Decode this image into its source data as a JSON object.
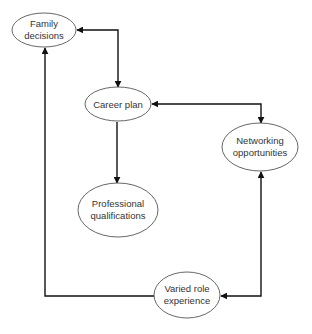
{
  "diagram": {
    "type": "flow",
    "nodes": [
      {
        "id": "family",
        "lines": [
          "Family",
          "decisions"
        ],
        "cx": 44,
        "cy": 30,
        "rx": 32,
        "ry": 17
      },
      {
        "id": "career",
        "lines": [
          "Career plan"
        ],
        "cx": 118,
        "cy": 104,
        "rx": 33,
        "ry": 17
      },
      {
        "id": "networking",
        "lines": [
          "Networking",
          "opportunities"
        ],
        "cx": 260,
        "cy": 147,
        "rx": 38,
        "ry": 24
      },
      {
        "id": "professional",
        "lines": [
          "Professional",
          "qualifications"
        ],
        "cx": 118,
        "cy": 210,
        "rx": 40,
        "ry": 27
      },
      {
        "id": "varied",
        "lines": [
          "Varied role",
          "experience"
        ],
        "cx": 187,
        "cy": 295,
        "rx": 33,
        "ry": 23
      }
    ],
    "edges": [
      {
        "from": "career",
        "to": "family",
        "bidirectional": true,
        "label": ""
      },
      {
        "from": "career",
        "to": "professional",
        "bidirectional": false,
        "label": ""
      },
      {
        "from": "career",
        "to": "networking",
        "bidirectional": true,
        "label": ""
      },
      {
        "from": "networking",
        "to": "varied",
        "bidirectional": true,
        "label": ""
      },
      {
        "from": "varied",
        "to": "family",
        "bidirectional": false,
        "label": ""
      }
    ]
  },
  "labels": {
    "family_l1": "Family",
    "family_l2": "decisions",
    "career_l1": "Career plan",
    "networking_l1": "Networking",
    "networking_l2": "opportunities",
    "professional_l1": "Professional",
    "professional_l2": "qualifications",
    "varied_l1": "Varied role",
    "varied_l2": "experience"
  }
}
